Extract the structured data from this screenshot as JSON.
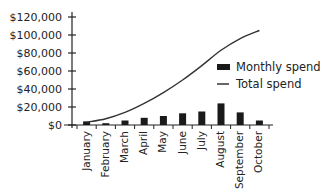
{
  "chart_data": {
    "type": "bar+line",
    "title": "",
    "xlabel": "",
    "ylabel": "",
    "categories": [
      "January",
      "February",
      "March",
      "April",
      "May",
      "June",
      "July",
      "August",
      "September",
      "October"
    ],
    "series": [
      {
        "name": "Monthly spend",
        "type": "bar",
        "values": [
          4000,
          2000,
          5000,
          8000,
          10000,
          13000,
          15000,
          24000,
          14000,
          5000
        ]
      },
      {
        "name": "Total spend",
        "type": "line",
        "values": [
          3000,
          7000,
          14000,
          24000,
          36000,
          50000,
          66000,
          83000,
          96000,
          105000
        ]
      }
    ],
    "y_ticks": [
      "$0",
      "$20,000",
      "$40,000",
      "$60,000",
      "$80,000",
      "$100,000",
      "$120,000"
    ],
    "ylim": [
      0,
      120000
    ],
    "grid": false,
    "legend_position": "right"
  },
  "legend": {
    "monthly_label": "Monthly spend",
    "total_label": "Total spend"
  },
  "colors": {
    "bar": "#1a1a1a",
    "line": "#333333",
    "axis": "#222222"
  }
}
